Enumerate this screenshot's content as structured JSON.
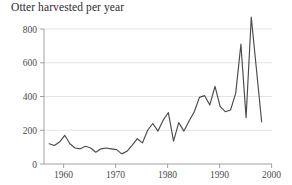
{
  "chart_data": {
    "type": "line",
    "title": "Otter harvested per year",
    "xlabel": "",
    "ylabel": "",
    "grid": true,
    "legend": "none",
    "xlim": [
      1956,
      2000
    ],
    "ylim": [
      0,
      870
    ],
    "yticks": [
      0,
      200,
      400,
      600,
      800
    ],
    "ytick_labels": [
      "0",
      "200",
      "400",
      "600",
      "800"
    ],
    "xticks": [
      1960,
      1970,
      1980,
      1990,
      2000
    ],
    "xtick_labels": [
      "1960",
      "1970",
      "1980",
      "1990",
      "2000"
    ],
    "line_color": "#4a4a4a",
    "grid_color": "#d9d9d9",
    "axis_color": "#8a8a8a",
    "x": [
      1957,
      1958,
      1959,
      1960,
      1961,
      1962,
      1963,
      1964,
      1965,
      1966,
      1967,
      1968,
      1969,
      1970,
      1971,
      1972,
      1973,
      1974,
      1975,
      1976,
      1977,
      1978,
      1979,
      1980,
      1981,
      1982,
      1983,
      1984,
      1985,
      1986,
      1987,
      1988,
      1989,
      1990,
      1991,
      1992,
      1993,
      1994,
      1995,
      1996,
      1997,
      1998
    ],
    "values": [
      120,
      110,
      130,
      170,
      120,
      95,
      90,
      105,
      95,
      70,
      90,
      95,
      90,
      85,
      60,
      75,
      110,
      150,
      125,
      200,
      240,
      195,
      260,
      305,
      135,
      245,
      195,
      255,
      310,
      395,
      405,
      350,
      460,
      340,
      310,
      320,
      420,
      710,
      275,
      870,
      560,
      250
    ]
  }
}
